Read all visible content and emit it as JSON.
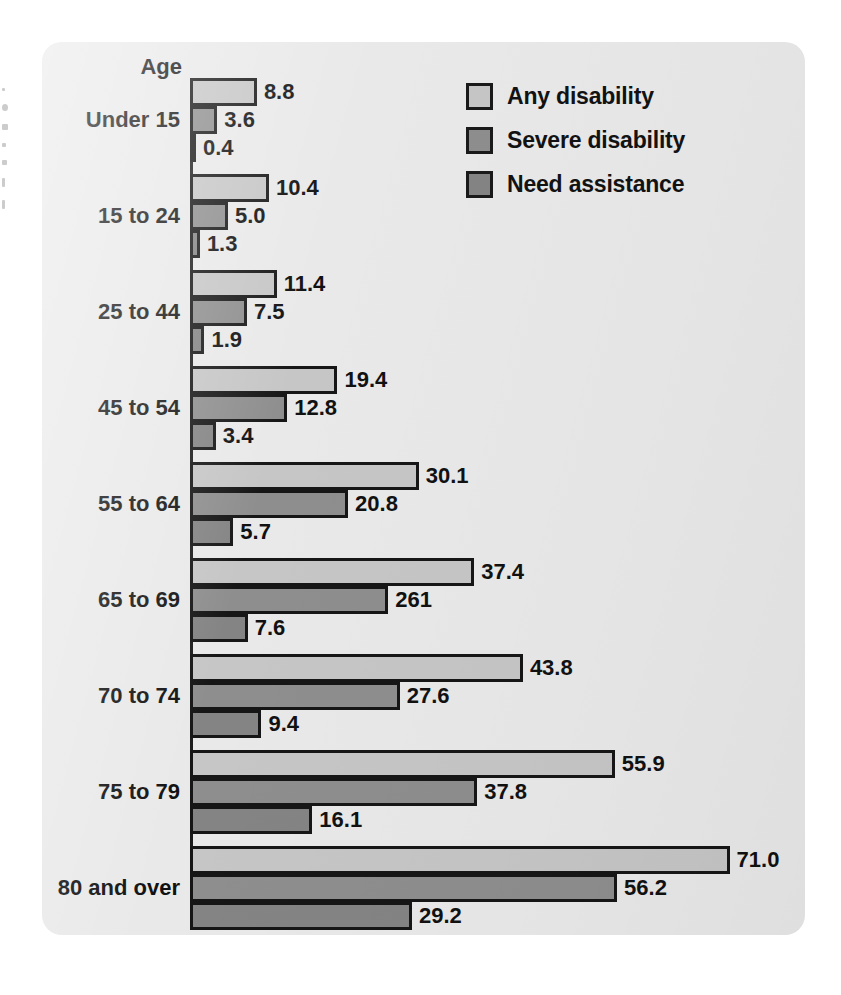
{
  "chart_data": {
    "type": "bar",
    "orientation": "horizontal",
    "title": "",
    "xlabel": "",
    "ylabel": "Age",
    "axis_header": "Age",
    "categories": [
      "Under 15",
      "15 to 24",
      "25 to 44",
      "45 to 54",
      "55 to 64",
      "65 to 69",
      "70 to 74",
      "75 to 79",
      "80 and over"
    ],
    "series": [
      {
        "name": "Any disability",
        "color": "#c6c6c6",
        "values": [
          8.8,
          10.4,
          11.4,
          19.4,
          30.1,
          37.4,
          43.8,
          55.9,
          71.0
        ],
        "labels": [
          "8.8",
          "10.4",
          "11.4",
          "19.4",
          "30.1",
          "37.4",
          "43.8",
          "55.9",
          "71.0"
        ]
      },
      {
        "name": "Severe disability",
        "color": "#8e8e8e",
        "values": [
          3.6,
          5.0,
          7.5,
          12.8,
          20.8,
          26.1,
          27.6,
          37.8,
          56.2
        ],
        "labels": [
          "3.6",
          "5.0",
          "7.5",
          "12.8",
          "20.8",
          "261",
          "27.6",
          "37.8",
          "56.2"
        ]
      },
      {
        "name": "Need assistance",
        "color": "#848484",
        "values": [
          0.4,
          1.3,
          1.9,
          3.4,
          5.7,
          7.6,
          9.4,
          16.1,
          29.2
        ],
        "labels": [
          "0.4",
          "1.3",
          "1.9",
          "3.4",
          "5.7",
          "7.6",
          "9.4",
          "16.1",
          "29.2"
        ]
      }
    ],
    "xlim": [
      0,
      71
    ],
    "grid": false,
    "legend_position": "top-right"
  },
  "legend": {
    "items": [
      {
        "label": "Any disability",
        "color": "#c6c6c6"
      },
      {
        "label": "Severe disability",
        "color": "#8e8e8e"
      },
      {
        "label": "Need assistance",
        "color": "#848484"
      }
    ]
  }
}
